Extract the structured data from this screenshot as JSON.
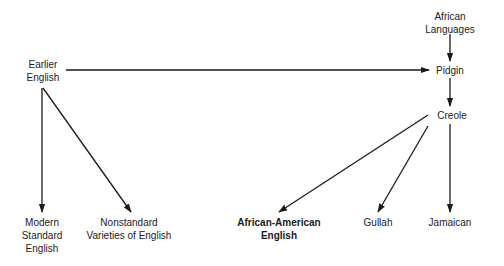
{
  "diagram": {
    "type": "flow",
    "nodes": {
      "earlier_english": {
        "lines": [
          "Earlier",
          "English"
        ]
      },
      "african_languages": {
        "lines": [
          "African",
          "Languages"
        ]
      },
      "pidgin": {
        "lines": [
          "Pidgin"
        ]
      },
      "creole": {
        "lines": [
          "Creole"
        ]
      },
      "modern_standard_english": {
        "lines": [
          "Modern",
          "Standard",
          "English"
        ]
      },
      "nonstandard_varieties": {
        "lines": [
          "Nonstandard",
          "Varieties of English"
        ]
      },
      "african_american_english": {
        "lines": [
          "African-American",
          "English"
        ],
        "emphasis": "bold"
      },
      "gullah": {
        "lines": [
          "Gullah"
        ]
      },
      "jamaican": {
        "lines": [
          "Jamaican"
        ]
      }
    },
    "edges": [
      {
        "from": "earlier_english",
        "to": "pidgin"
      },
      {
        "from": "african_languages",
        "to": "pidgin"
      },
      {
        "from": "pidgin",
        "to": "creole"
      },
      {
        "from": "earlier_english",
        "to": "modern_standard_english"
      },
      {
        "from": "earlier_english",
        "to": "nonstandard_varieties"
      },
      {
        "from": "creole",
        "to": "african_american_english"
      },
      {
        "from": "creole",
        "to": "gullah"
      },
      {
        "from": "creole",
        "to": "jamaican"
      }
    ]
  }
}
